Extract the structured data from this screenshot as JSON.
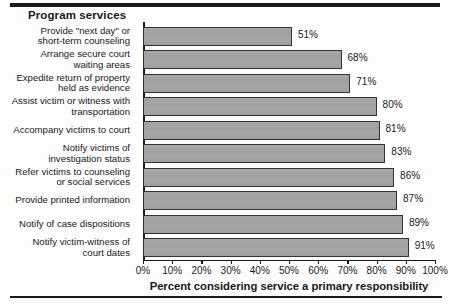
{
  "header": {
    "column_title": "Program services"
  },
  "chart_data": {
    "type": "bar",
    "orientation": "horizontal",
    "title": "",
    "xlabel": "Percent considering service a primary responsibility",
    "ylabel": "Program services",
    "xlim": [
      0,
      100
    ],
    "grid": false,
    "legend": null,
    "tick_labels": [
      "0%",
      "10%",
      "20%",
      "30%",
      "40%",
      "50%",
      "60%",
      "70%",
      "80%",
      "90%",
      "100%"
    ],
    "tick_values": [
      0,
      10,
      20,
      30,
      40,
      50,
      60,
      70,
      80,
      90,
      100
    ],
    "categories": [
      "Provide \"next day\" or\nshort-term counseling",
      "Arrange secure court\nwaiting areas",
      "Expedite return of property\nheld as evidence",
      "Assist victim or witness with\ntransportation",
      "Accompany victims to court",
      "Notify victims of\ninvestigation status",
      "Refer victims to counseling\nor social services",
      "Provide printed information",
      "Notify of case dispositions",
      "Notify victim-witness of\ncourt dates"
    ],
    "values": [
      51,
      68,
      71,
      80,
      81,
      83,
      86,
      87,
      89,
      91
    ],
    "value_labels": [
      "51%",
      "68%",
      "71%",
      "80%",
      "81%",
      "83%",
      "86%",
      "87%",
      "89%",
      "91%"
    ],
    "bar_color": "#a3a3a3",
    "bar_edge_color": "#333333",
    "text_color": "#1a1a1a"
  }
}
